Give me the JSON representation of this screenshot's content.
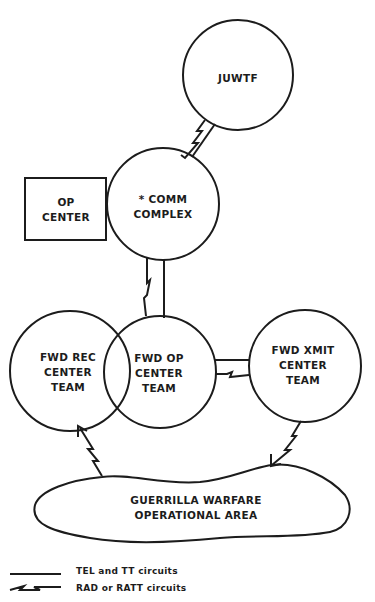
{
  "nodes": {
    "juwtf": {
      "label": "JUWTF",
      "shape": "circle"
    },
    "op_center": {
      "label": "OP\nCENTER",
      "shape": "rectangle"
    },
    "comm_complex": {
      "label": "* COMM\nCOMPLEX",
      "shape": "circle"
    },
    "fwd_rec": {
      "label": "FWD REC\nCENTER\nTEAM",
      "shape": "circle"
    },
    "fwd_op": {
      "label": "FWD OP\nCENTER\nTEAM",
      "shape": "circle"
    },
    "fwd_xmit": {
      "label": "FWD XMIT\nCENTER\nTEAM",
      "shape": "circle"
    },
    "guerrilla_area": {
      "label": "GUERRILLA WARFARE\nOPERATIONAL AREA",
      "shape": "cloud"
    }
  },
  "links": [
    {
      "from": "juwtf",
      "to": "comm_complex",
      "types": [
        "TEL/TT",
        "RAD/RATT"
      ]
    },
    {
      "from": "comm_complex",
      "to": "fwd_op",
      "types": [
        "TEL/TT",
        "RAD/RATT"
      ]
    },
    {
      "from": "fwd_op",
      "to": "fwd_xmit",
      "types": [
        "TEL/TT",
        "RAD/RATT"
      ]
    },
    {
      "from": "guerrilla_area",
      "to": "fwd_rec",
      "types": [
        "RAD/RATT"
      ]
    },
    {
      "from": "fwd_xmit",
      "to": "guerrilla_area",
      "types": [
        "RAD/RATT"
      ]
    }
  ],
  "legend": {
    "solid": "TEL and TT circuits",
    "zigzag": "RAD or RATT circuits"
  },
  "colors": {
    "ink": "#1c1c1c",
    "paper": "#ffffff"
  }
}
